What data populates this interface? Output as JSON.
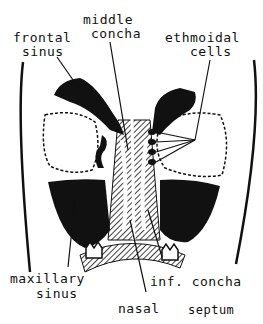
{
  "diagram": {
    "type": "anatomical-cross-section",
    "colors": {
      "ink": "#111111",
      "background": "#ffffff"
    },
    "labels": {
      "frontal_sinus": [
        "frontal",
        "sinus"
      ],
      "middle_concha": [
        "middle",
        "concha"
      ],
      "ethmoidal_cells": [
        "ethmoidal",
        "cells"
      ],
      "maxillary_sinus": [
        "maxillary",
        "sinus"
      ],
      "inf_concha": "inf. concha",
      "nasal_septum": [
        "nasal",
        "septum"
      ]
    }
  }
}
